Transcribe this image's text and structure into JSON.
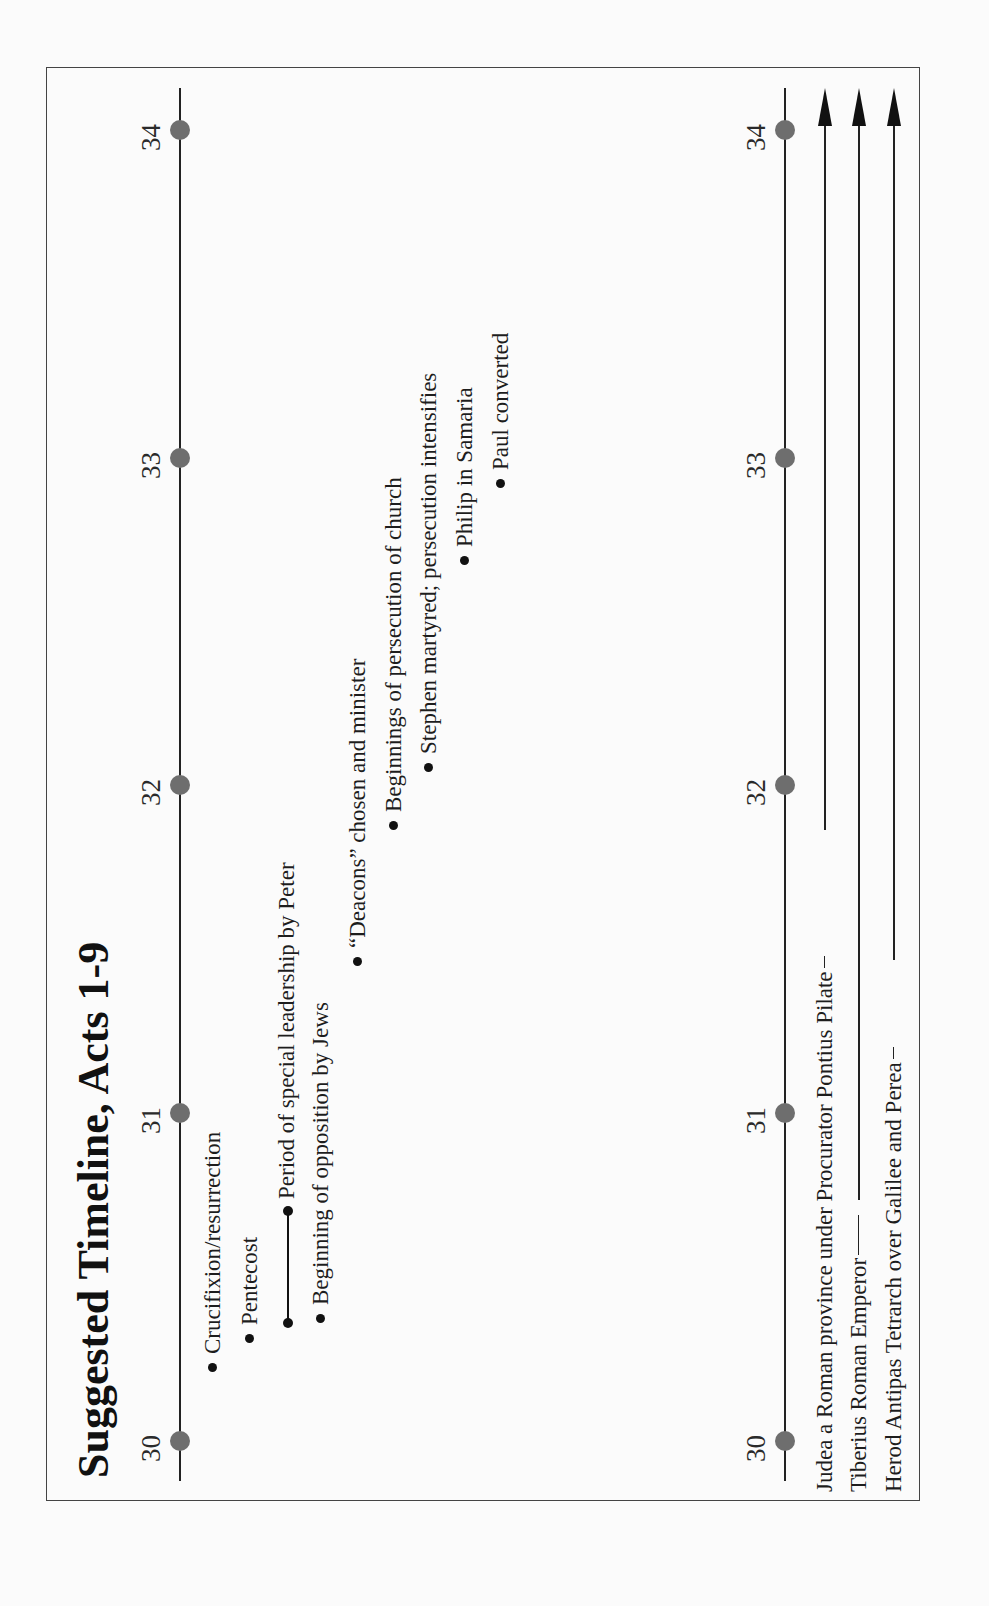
{
  "document": {
    "title": "Suggested Timeline, Acts 1-9",
    "orientation": "rotated 90deg counter-clockwise"
  },
  "timeline": {
    "years": [
      "30",
      "31",
      "32",
      "33",
      "34"
    ],
    "events": [
      {
        "label": "Crucifixion/resurrection",
        "year_position": 30.2
      },
      {
        "label": "Pentecost",
        "year_position": 30.3
      },
      {
        "label": "Period of special leadership by Peter",
        "year_position_start": 30.3,
        "year_position_end": 30.7
      },
      {
        "label": "Beginning of opposition by Jews",
        "year_position": 30.4
      },
      {
        "label": "“Deacons” chosen and minister",
        "year_position": 31.5
      },
      {
        "label": "Beginnings of persecution of church",
        "year_position": 31.9
      },
      {
        "label": "Stephen martyred; persecution intensifies",
        "year_position": 32.1
      },
      {
        "label": "Philip in Samaria",
        "year_position": 32.7
      },
      {
        "label": "Paul converted",
        "year_position": 32.9
      }
    ]
  },
  "rulers": [
    {
      "label": "Judea a Roman province under Procurator Pontius Pilate",
      "continues": true
    },
    {
      "label": "Tiberius Roman Emperor",
      "continues": true
    },
    {
      "label": "Herod Antipas Tetrarch over Galilee and Perea",
      "continues": true
    }
  ],
  "colors": {
    "year_dot": "#6e6e6e",
    "axis": "#222222",
    "text": "#1d1d1d",
    "frame": "#444444"
  }
}
